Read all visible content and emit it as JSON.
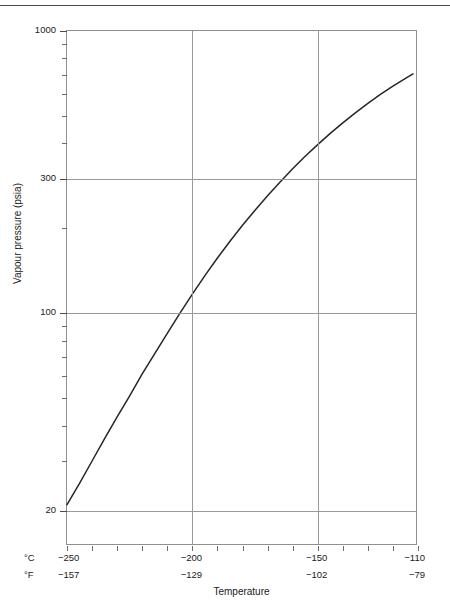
{
  "figure": {
    "x_axis_title": "Temperature",
    "y_axis_title": "Vapour pressure (psia)",
    "unit_celsius": "°C",
    "unit_fahrenheit": "°F"
  },
  "chart_data": {
    "type": "line",
    "title": "",
    "xlabel": "Temperature",
    "ylabel": "Vapour pressure (psia)",
    "yscale": "log",
    "xscale": "linear",
    "xlim": [
      -250,
      -110
    ],
    "ylim": [
      15,
      1000
    ],
    "grid": true,
    "legend": null,
    "y_ticklabels": [
      "1000",
      "300",
      "100",
      "20"
    ],
    "y_tickvalues": [
      1000,
      300,
      100,
      20
    ],
    "y_minor_ticks": [
      900,
      800,
      700,
      600,
      500,
      400,
      200,
      90,
      80,
      70,
      60,
      50,
      40,
      30
    ],
    "x_ticklabels_celsius": [
      "−250",
      "−200",
      "−150",
      "−110"
    ],
    "x_tickvalues_celsius": [
      -250,
      -200,
      -150,
      -110
    ],
    "x_ticklabels_fahrenheit": [
      "−157",
      "−129",
      "−102",
      "−79"
    ],
    "x_minor_tick_step_celsius": 10,
    "line_color": "#262626",
    "series": [
      {
        "name": "Vapour pressure",
        "x": [
          -250,
          -245,
          -240,
          -235,
          -230,
          -225,
          -220,
          -215,
          -210,
          -205,
          -200,
          -195,
          -190,
          -185,
          -180,
          -175,
          -170,
          -165,
          -160,
          -155,
          -150,
          -145,
          -140,
          -135,
          -130,
          -125,
          -120,
          -115,
          -112
        ],
        "y": [
          21,
          25,
          30,
          36,
          43,
          51,
          61,
          72,
          85,
          100,
          117,
          136,
          157,
          180,
          205,
          232,
          261,
          292,
          325,
          360,
          396,
          434,
          473,
          513,
          554,
          596,
          638,
          680,
          705
        ]
      }
    ]
  }
}
